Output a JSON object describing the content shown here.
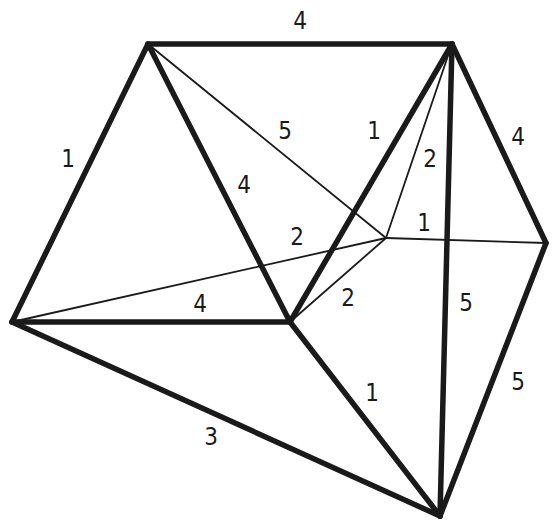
{
  "diagram": {
    "type": "weighted-graph",
    "vertices": [
      {
        "id": "A",
        "x": 148,
        "y": 44
      },
      {
        "id": "B",
        "x": 452,
        "y": 44
      },
      {
        "id": "C",
        "x": 12,
        "y": 322
      },
      {
        "id": "D",
        "x": 290,
        "y": 322
      },
      {
        "id": "E",
        "x": 386,
        "y": 238
      },
      {
        "id": "F",
        "x": 546,
        "y": 243
      },
      {
        "id": "G",
        "x": 440,
        "y": 516
      }
    ],
    "edges": [
      {
        "from": "A",
        "to": "B",
        "weight": "4",
        "style": "thick",
        "label_x": 300,
        "label_y": 22
      },
      {
        "from": "A",
        "to": "C",
        "weight": "1",
        "style": "thick",
        "label_x": 68,
        "label_y": 160
      },
      {
        "from": "A",
        "to": "D",
        "weight": "4",
        "style": "thick",
        "label_x": 244,
        "label_y": 186
      },
      {
        "from": "A",
        "to": "E",
        "weight": "5",
        "style": "thin",
        "label_x": 285,
        "label_y": 132
      },
      {
        "from": "B",
        "to": "D",
        "weight": "1",
        "style": "thick",
        "label_x": 374,
        "label_y": 132
      },
      {
        "from": "B",
        "to": "E",
        "weight": "2",
        "style": "thin",
        "label_x": 430,
        "label_y": 160
      },
      {
        "from": "B",
        "to": "G",
        "weight": "5",
        "style": "thick",
        "label_x": 466,
        "label_y": 304
      },
      {
        "from": "B",
        "to": "F",
        "weight": "4",
        "style": "thick",
        "label_x": 518,
        "label_y": 138
      },
      {
        "from": "E",
        "to": "F",
        "weight": "1",
        "style": "thin",
        "label_x": 424,
        "label_y": 224
      },
      {
        "from": "C",
        "to": "E",
        "weight": "2",
        "style": "thin",
        "label_x": 297,
        "label_y": 238
      },
      {
        "from": "C",
        "to": "D",
        "weight": "4",
        "style": "thick",
        "label_x": 200,
        "label_y": 305
      },
      {
        "from": "D",
        "to": "E",
        "weight": "2",
        "style": "thin",
        "label_x": 348,
        "label_y": 299
      },
      {
        "from": "C",
        "to": "G",
        "weight": "3",
        "style": "thick",
        "label_x": 211,
        "label_y": 438
      },
      {
        "from": "D",
        "to": "G",
        "weight": "1",
        "style": "thick",
        "label_x": 372,
        "label_y": 394
      },
      {
        "from": "F",
        "to": "G",
        "weight": "5",
        "style": "thick",
        "label_x": 518,
        "label_y": 383
      }
    ]
  }
}
